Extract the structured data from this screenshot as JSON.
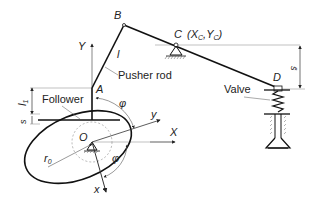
{
  "diagram": {
    "points": {
      "A": "A",
      "B": "B",
      "C": "C",
      "C_coords": "(X",
      "C_x_sub": "C",
      "C_comma": ",Y",
      "C_y_sub": "C",
      "C_close": ")",
      "D": "D",
      "O": "O"
    },
    "axes": {
      "X": "X",
      "Y": "Y",
      "x": "x",
      "y": "y"
    },
    "labels": {
      "pusher_rod": "Pusher rod",
      "follower": "Follower",
      "valve": "Valve",
      "rod_length": "l",
      "l1": "l",
      "l1_sub": "1",
      "s": "s",
      "s_bar": "s̄",
      "r0": "r",
      "r0_sub": "0",
      "phi_upper": "φ",
      "phi_lower": "φ"
    },
    "colors": {
      "line": "#111111",
      "thin": "#555555",
      "dash": "#888888"
    }
  }
}
